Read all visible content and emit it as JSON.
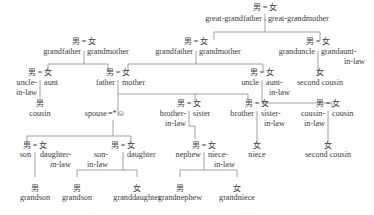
{
  "diagram": {
    "type": "family-tree",
    "symbols": {
      "male": "男",
      "female": "女",
      "marriage": "=",
      "self": "☺",
      "self_marker": "*"
    },
    "nodes": {
      "gg": {
        "sym": "男 = 女",
        "left": "great-grandfather",
        "right": "great-grandmother"
      },
      "gp": {
        "sym": "男 = 女",
        "left": "grandfather",
        "right": "grandmother"
      },
      "gp2": {
        "sym": "男 = 女",
        "left": "grandfather",
        "right": "grandmother"
      },
      "gu": {
        "sym": "男 = 女",
        "left": "granduncle",
        "right": "grandaunt-",
        "right2": "in-law"
      },
      "ul": {
        "sym": "男 = 女",
        "left": "uncle-",
        "left2": "in-law",
        "right": "aunt"
      },
      "fm": {
        "sym": "男 = 女",
        "left": "father",
        "right": "mother"
      },
      "ua": {
        "sym": "男 = 女",
        "left": "uncle",
        "right": "aunt-",
        "right2": "in-law"
      },
      "sc1": {
        "sym": "女",
        "label": "second cousin"
      },
      "cousin1": {
        "sym": "男",
        "label": "cousin"
      },
      "self": {
        "label": "spouse",
        "marker": "=*☺"
      },
      "bs": {
        "sym": "男 = 女",
        "left": "brother-",
        "left2": "in-law",
        "right": "sister"
      },
      "bsl": {
        "sym": "男 = 女",
        "left": "brother",
        "right": "sister-",
        "right2": "in-law"
      },
      "cc": {
        "sym": "男 = 女",
        "left": "cousin-",
        "left2": "in-law",
        "right": "cousin"
      },
      "sd": {
        "sym": "男 = 女",
        "left": "son",
        "right": "daughter-",
        "right2": "in-law"
      },
      "sld": {
        "sym": "男 = 女",
        "left": "son-",
        "left2": "in-law",
        "right": "daughter"
      },
      "nn": {
        "sym": "男 = 女",
        "left": "nephew",
        "right": "niece-",
        "right2": "in-law"
      },
      "niece": {
        "sym": "女",
        "label": "niece"
      },
      "sc2": {
        "sym": "女",
        "label": "second cousin"
      },
      "gs1": {
        "sym": "男",
        "label": "grandson"
      },
      "gs2": {
        "sym": "男",
        "label": "grandson"
      },
      "gd": {
        "sym": "女",
        "label": "granddaughter"
      },
      "gn": {
        "sym": "男",
        "label": "grandnephew"
      },
      "gni": {
        "sym": "女",
        "label": "grandniece"
      }
    }
  }
}
